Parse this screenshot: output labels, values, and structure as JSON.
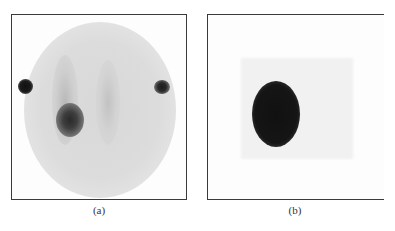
{
  "figure": {
    "panels": [
      {
        "id": "a",
        "caption": "(a)",
        "description": "Scintigraphic image: circular field with two vertical uptake stripes, a dark hot spot on the left stripe, and two dark reference markers at left and right edges",
        "features": [
          "circular-field",
          "left-stripe",
          "right-stripe",
          "hot-spot",
          "left-marker",
          "right-marker"
        ]
      },
      {
        "id": "b",
        "caption": "(b)",
        "description": "Image with a single large dark oval hot spot on a faint gray rectangular background",
        "features": [
          "background-rectangle",
          "hot-spot"
        ]
      }
    ],
    "colors": {
      "border": "#3a3a3a",
      "hot_spot": "#1a1a1a",
      "field_gray": "#d8d8d8"
    }
  }
}
